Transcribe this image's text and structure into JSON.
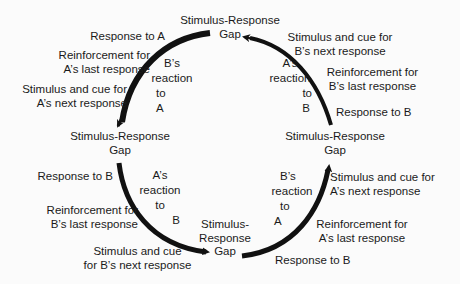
{
  "nodes": {
    "top": {
      "line1": "Stimulus-Response",
      "line2": "Gap"
    },
    "left": {
      "line1": "Stimulus-Response",
      "line2": "Gap"
    },
    "right": {
      "line1": "Stimulus-Response",
      "line2": "Gap"
    },
    "bottom": {
      "line1": "Stimulus-",
      "line2": "Response",
      "line3": "Gap"
    }
  },
  "arcs": {
    "top_left": {
      "reaction": [
        "B’s",
        "reaction",
        "to",
        "A"
      ],
      "outer": [
        {
          "lines": [
            "Response to A"
          ]
        },
        {
          "lines": [
            "Reinforcement for",
            "A’s last response"
          ]
        },
        {
          "lines": [
            "Stimulus and cue for",
            "A’s next response"
          ]
        }
      ]
    },
    "top_right": {
      "reaction": [
        "A’s",
        "reaction",
        "to",
        "B"
      ],
      "outer": [
        {
          "lines": [
            "Stimulus and cue for",
            "B’s next response"
          ]
        },
        {
          "lines": [
            "Reinforcement for",
            "B’s last response"
          ]
        },
        {
          "lines": [
            "Response to B"
          ]
        }
      ]
    },
    "bottom_left": {
      "reaction": [
        "A’s",
        "reaction",
        "to",
        "B"
      ],
      "outer": [
        {
          "lines": [
            "Response to B"
          ]
        },
        {
          "lines": [
            "Reinforcement for",
            "B’s last response"
          ]
        },
        {
          "lines": [
            "Stimulus and cue",
            "for B’s next response"
          ]
        }
      ]
    },
    "bottom_right": {
      "reaction": [
        "B’s",
        "reaction",
        "to",
        "A"
      ],
      "outer": [
        {
          "lines": [
            "Stimulus and cue for",
            "A’s next response"
          ]
        },
        {
          "lines": [
            "Reinforcement for",
            "A’s last response"
          ]
        },
        {
          "lines": [
            "Response to B"
          ]
        }
      ]
    }
  },
  "colors": {
    "ink": "#111111",
    "background": "#fbfbfb"
  }
}
